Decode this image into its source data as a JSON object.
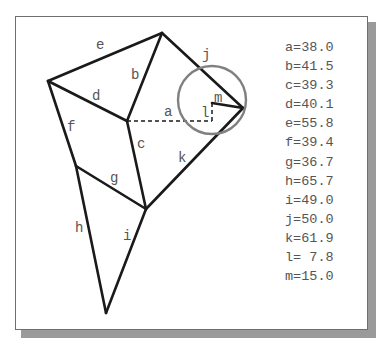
{
  "diagram": {
    "colors": {
      "edge": "#1a1a1a",
      "circle": "#808080",
      "label": "#555555",
      "frame_border": "#6e6e6e",
      "shadow": "#9a9a9a"
    },
    "edge_labels": {
      "a": "a",
      "b": "b",
      "c": "c",
      "d": "d",
      "e": "e",
      "f": "f",
      "g": "g",
      "h": "h",
      "i": "i",
      "j": "j",
      "k": "k",
      "l": "l",
      "m": "m"
    }
  },
  "measurements": [
    {
      "name": "a",
      "value": "38.0",
      "text": "a=38.0"
    },
    {
      "name": "b",
      "value": "41.5",
      "text": "b=41.5"
    },
    {
      "name": "c",
      "value": "39.3",
      "text": "c=39.3"
    },
    {
      "name": "d",
      "value": "40.1",
      "text": "d=40.1"
    },
    {
      "name": "e",
      "value": "55.8",
      "text": "e=55.8"
    },
    {
      "name": "f",
      "value": "39.4",
      "text": "f=39.4"
    },
    {
      "name": "g",
      "value": "36.7",
      "text": "g=36.7"
    },
    {
      "name": "h",
      "value": "65.7",
      "text": "h=65.7"
    },
    {
      "name": "i",
      "value": "49.0",
      "text": "i=49.0"
    },
    {
      "name": "j",
      "value": "50.0",
      "text": "j=50.0"
    },
    {
      "name": "k",
      "value": "61.9",
      "text": "k=61.9"
    },
    {
      "name": "l",
      "value": "7.8",
      "text": "l= 7.8"
    },
    {
      "name": "m",
      "value": "15.0",
      "text": "m=15.0"
    }
  ]
}
